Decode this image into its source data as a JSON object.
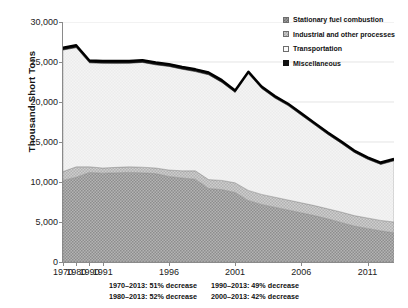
{
  "axes": {
    "ylabel": "Thousand Short Tons",
    "yticks": [
      "30,000",
      "25,000",
      "20,000",
      "15,000",
      "10,000",
      "5,000",
      "0"
    ],
    "xticks": [
      "1970",
      "1980",
      "1990",
      "1991",
      "1996",
      "2001",
      "2006",
      "2011"
    ]
  },
  "legend": [
    {
      "label": "Stationary fuel combustion",
      "swatch": "stationary-swatch-icon",
      "color": "#9a9a9a"
    },
    {
      "label": "Industrial and other processes",
      "swatch": "industrial-swatch-icon",
      "color": "#c9c9c9"
    },
    {
      "label": "Transportation",
      "swatch": "transportation-swatch-icon",
      "color": "#fbfbfb"
    },
    {
      "label": "Miscellaneous",
      "swatch": "miscellaneous-swatch-icon",
      "color": "#111111"
    }
  ],
  "footnotes": [
    "1970–2013: 51% decrease",
    "1990–2013: 49% decrease",
    "1980–2013: 52% decrease",
    "2000–2013: 42% decrease"
  ],
  "chart_data": {
    "type": "area",
    "stacked": true,
    "title": "",
    "xlabel": "",
    "ylabel": "Thousand Short Tons",
    "ylim": [
      0,
      30000
    ],
    "ytick_values": [
      0,
      5000,
      10000,
      15000,
      20000,
      25000,
      30000
    ],
    "grid": "horizontal-faint",
    "legend_position": "top-right-inside",
    "x": [
      1970,
      1980,
      1990,
      1991,
      1992,
      1993,
      1994,
      1995,
      1996,
      1997,
      1998,
      1999,
      2000,
      2001,
      2002,
      2003,
      2004,
      2005,
      2006,
      2007,
      2008,
      2009,
      2010,
      2011,
      2012,
      2013
    ],
    "xtick_labels": [
      "1970",
      "1980",
      "1990",
      "1991",
      "1996",
      "2001",
      "2006",
      "2011"
    ],
    "xtick_values": [
      1970,
      1980,
      1990,
      1991,
      1996,
      2001,
      2006,
      2011
    ],
    "series": [
      {
        "name": "Stationary fuel combustion",
        "color": "#9a9a9a",
        "values": [
          10200,
          10600,
          11200,
          11100,
          11150,
          11200,
          11150,
          11050,
          10700,
          10500,
          10350,
          9200,
          9050,
          8700,
          7700,
          7200,
          6850,
          6500,
          6150,
          5800,
          5400,
          4950,
          4500,
          4200,
          3900,
          3650
        ]
      },
      {
        "name": "Industrial and other processes",
        "color": "#c9c9c9",
        "values": [
          1100,
          1300,
          700,
          650,
          680,
          700,
          700,
          700,
          800,
          900,
          1050,
          1100,
          1150,
          1200,
          1250,
          1250,
          1250,
          1250,
          1250,
          1250,
          1250,
          1300,
          1300,
          1300,
          1300,
          1350
        ]
      },
      {
        "name": "Transportation",
        "color": "#fbfbfb",
        "values": [
          15200,
          14900,
          13000,
          13100,
          13000,
          12950,
          13100,
          12900,
          12950,
          12700,
          12400,
          13100,
          12250,
          11300,
          14600,
          13250,
          12400,
          11800,
          10950,
          10100,
          9300,
          8600,
          7900,
          7350,
          7000,
          7650
        ]
      },
      {
        "name": "Miscellaneous",
        "color": "#111111",
        "values": [
          300,
          300,
          300,
          300,
          300,
          300,
          300,
          300,
          300,
          300,
          300,
          300,
          300,
          250,
          250,
          250,
          250,
          250,
          250,
          250,
          250,
          250,
          250,
          250,
          250,
          250
        ]
      }
    ],
    "totals": [
      26800,
      27100,
      25200,
      25150,
      25130,
      25150,
      25250,
      24950,
      24750,
      24400,
      24100,
      23700,
      22750,
      21450,
      23800,
      21950,
      20750,
      19800,
      18600,
      17400,
      16200,
      15100,
      13950,
      13100,
      12450,
      12900
    ],
    "annotations": [
      "1970–2013: 51% decrease",
      "1980–2013: 52% decrease",
      "1990–2013: 49% decrease",
      "2000–2013: 42% decrease"
    ]
  }
}
